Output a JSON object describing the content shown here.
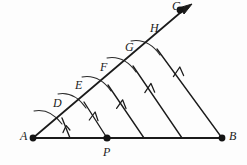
{
  "figure": {
    "type": "geometry-diagram",
    "background_color": "#fdfdfd",
    "ink_color": "#1b1b1b",
    "canvas": {
      "width": 247,
      "height": 165
    },
    "points": [
      {
        "id": "A",
        "label": "A",
        "x": 33,
        "y": 138,
        "dot": true,
        "label_x": 20,
        "label_y": 131
      },
      {
        "id": "B",
        "label": "B",
        "x": 222,
        "y": 138,
        "dot": true,
        "label_x": 229,
        "label_y": 131
      },
      {
        "id": "C",
        "label": "C",
        "x": 180,
        "y": 10,
        "dot": true,
        "label_x": 173,
        "label_y": 0
      },
      {
        "id": "D",
        "label": "D",
        "x": 62,
        "y": 118,
        "dot": false,
        "label_x": 53,
        "label_y": 98
      },
      {
        "id": "E",
        "label": "E",
        "x": 84,
        "y": 102,
        "dot": false,
        "label_x": 75,
        "label_y": 80
      },
      {
        "id": "F",
        "label": "F",
        "x": 108,
        "y": 85,
        "dot": false,
        "label_x": 100,
        "label_y": 62
      },
      {
        "id": "G",
        "label": "G",
        "x": 133,
        "y": 66,
        "dot": false,
        "label_x": 125,
        "label_y": 42
      },
      {
        "id": "H",
        "label": "H",
        "x": 157,
        "y": 49,
        "dot": false,
        "label_x": 150,
        "label_y": 23
      },
      {
        "id": "P",
        "label": "P",
        "x": 107,
        "y": 138,
        "dot": true,
        "label_x": 103,
        "label_y": 147
      }
    ],
    "base_segment": {
      "from": "A",
      "to": "B",
      "name": "segment-AB"
    },
    "ray": {
      "from": "A",
      "through": "C",
      "name": "ray-AC",
      "arrow_tip_x": 192,
      "arrow_tip_y": 4,
      "has_arrowhead": true
    },
    "parallel_lines": [
      {
        "name": "parallel-D-to-base",
        "from_x": 62,
        "from_y": 118,
        "to_x": 70,
        "to_y": 138,
        "tick_marks": 1
      },
      {
        "name": "parallel-E-to-P",
        "from_x": 84,
        "from_y": 102,
        "to_x": 107,
        "to_y": 138,
        "tick_marks": 1
      },
      {
        "name": "parallel-F-to-base",
        "from_x": 108,
        "from_y": 85,
        "to_x": 144,
        "to_y": 138,
        "tick_marks": 1
      },
      {
        "name": "parallel-G-to-base",
        "from_x": 133,
        "from_y": 66,
        "to_x": 182,
        "to_y": 138,
        "tick_marks": 1
      },
      {
        "name": "parallel-H-to-B",
        "from_x": 157,
        "from_y": 49,
        "to_x": 222,
        "to_y": 138,
        "tick_marks": 1
      }
    ],
    "compass_arcs": [
      {
        "name": "compass-arc-at-D",
        "center_x": 35,
        "center_y": 140,
        "radius": 30,
        "through": "D"
      },
      {
        "name": "compass-arc-at-E",
        "center_x": 59,
        "center_y": 123,
        "radius": 30,
        "through": "E"
      },
      {
        "name": "compass-arc-at-F",
        "center_x": 83,
        "center_y": 106,
        "radius": 30,
        "through": "F"
      },
      {
        "name": "compass-arc-at-G",
        "center_x": 108,
        "center_y": 88,
        "radius": 30,
        "through": "G"
      },
      {
        "name": "compass-arc-at-H",
        "center_x": 132,
        "center_y": 70,
        "radius": 30,
        "through": "H"
      }
    ],
    "notes": {
      "equal_spacing": "Points D, E, F, G, H are equally spaced along ray AC",
      "parallel_marks": "Single chevron arrowheads mark the five mutually parallel lines"
    }
  }
}
